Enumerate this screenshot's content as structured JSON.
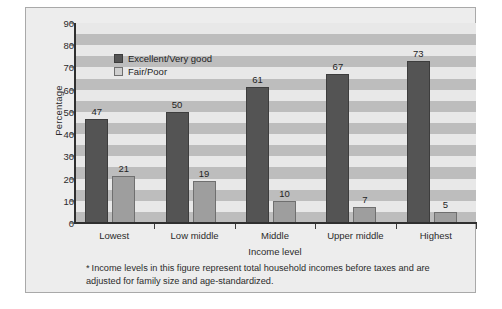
{
  "chart_data": {
    "type": "bar",
    "title": "",
    "xlabel": "Income level",
    "ylabel": "Percentage",
    "categories": [
      "Lowest",
      "Low middle",
      "Middle",
      "Upper middle",
      "Highest"
    ],
    "series": [
      {
        "name": "Excellent/Very good",
        "color": "#545454",
        "values": [
          47,
          50,
          61,
          67,
          73
        ]
      },
      {
        "name": "Fair/Poor",
        "color": "#9e9e9e",
        "values": [
          21,
          19,
          10,
          7,
          5
        ]
      }
    ],
    "ylim": [
      0,
      90
    ],
    "yticks": [
      0,
      10,
      20,
      30,
      40,
      50,
      60,
      70,
      80,
      90
    ],
    "ytick_labels": [
      "0",
      "10",
      "20",
      "30",
      "40",
      "50",
      "60",
      "70",
      "80",
      "90"
    ],
    "grid": "horizontal-bands",
    "band_colors": [
      "#e8e8e8",
      "#bdbdbd"
    ],
    "legend_position": "top-left-inside",
    "data_labels": true
  },
  "footnote": {
    "marker": "*",
    "text": "Income levels in this figure represent total household incomes before taxes and are adjusted for family size and age-standardized."
  }
}
